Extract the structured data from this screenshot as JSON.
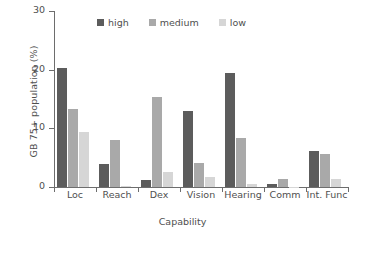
{
  "chart_data": {
    "type": "bar",
    "title": "",
    "xlabel": "Capability",
    "ylabel": "GB 75+ population (%)",
    "categories": [
      "Loc",
      "Reach",
      "Dex",
      "Vision",
      "Hearing",
      "Comm",
      "Int. Func"
    ],
    "series": [
      {
        "name": "high",
        "color": "#5c5c5c",
        "values": [
          20.3,
          4.0,
          1.2,
          12.9,
          19.4,
          0.5,
          6.1
        ]
      },
      {
        "name": "medium",
        "color": "#a9a9a9",
        "values": [
          13.3,
          8.0,
          15.4,
          4.1,
          8.3,
          1.4,
          5.6
        ]
      },
      {
        "name": "low",
        "color": "#d6d6d6",
        "values": [
          9.4,
          0.2,
          2.6,
          1.7,
          0.5,
          0.05,
          1.4
        ]
      }
    ],
    "ylim": [
      0,
      30
    ],
    "yticks": [
      0,
      10,
      20,
      30
    ],
    "ytick_labels": [
      "0",
      "10",
      "20",
      "30"
    ],
    "grid": false,
    "legend_position": "top-center",
    "legend": [
      "high",
      "medium",
      "low"
    ]
  },
  "axis": {
    "y_title": "GB 75+ population (%)",
    "x_title": "Capability"
  }
}
